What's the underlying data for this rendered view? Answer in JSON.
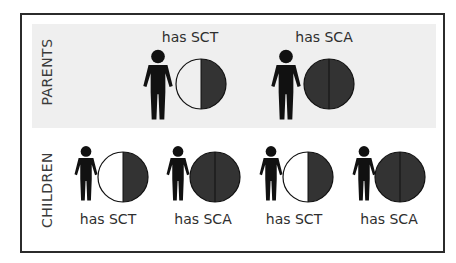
{
  "sections": {
    "parents": {
      "label": "PARENTS",
      "items": [
        {
          "caption": "has SCT",
          "genotype": "trait",
          "circle": "half-filled"
        },
        {
          "caption": "has SCA",
          "genotype": "anemia",
          "circle": "fully-filled"
        }
      ]
    },
    "children": {
      "label": "CHILDREN",
      "items": [
        {
          "caption": "has SCT",
          "genotype": "trait",
          "circle": "half-filled"
        },
        {
          "caption": "has SCA",
          "genotype": "anemia",
          "circle": "fully-filled"
        },
        {
          "caption": "has SCT",
          "genotype": "trait",
          "circle": "half-filled"
        },
        {
          "caption": "has SCA",
          "genotype": "anemia",
          "circle": "fully-filled"
        }
      ]
    }
  },
  "colors": {
    "figure": "#111111",
    "filled": "#333333",
    "empty": "#ffffff",
    "panel": "#efefef",
    "border": "#2b2b2b"
  }
}
